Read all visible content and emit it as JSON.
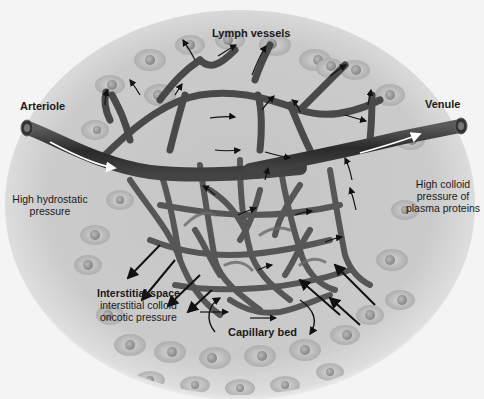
{
  "figure": {
    "subject": "capillary bed",
    "palette": {
      "background": "#f4f4f4",
      "tissue": "#c9c9c9",
      "cell": "#b3b3b3",
      "nucleus": "#8f8f8f",
      "vessel": "#4a4a4a",
      "vessel_dark": "#262626",
      "arrow": "#111111",
      "flow_arrow": "#ffffff",
      "text": "#1a1a1a"
    },
    "labels": {
      "lymph_vessels": "Lymph vessels",
      "arteriole": "Arteriole",
      "venule": "Venule",
      "high_hydrostatic_line1": "High hydrostatic",
      "high_hydrostatic_line2": "pressure",
      "high_colloid_line1": "High colloid",
      "high_colloid_line2": "pressure of",
      "high_colloid_line3": "plasma proteins",
      "interstitial_title": "Interstitial space",
      "interstitial_line2": "interstitial colloid",
      "interstitial_line3": "oncotic pressure",
      "capillary_bed": "Capillary bed"
    }
  }
}
